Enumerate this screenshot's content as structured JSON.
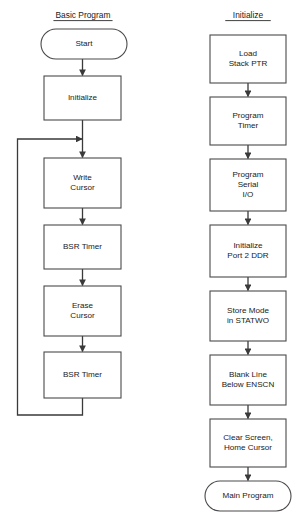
{
  "diagram": {
    "background_color": "#ffffff",
    "line_color": "#3a3a3a",
    "box_stroke_color": "#4a4a4a",
    "text_color": "#1a1a1a"
  },
  "columns": [
    {
      "id": "basic-program",
      "title": "Basic Program",
      "title_underlined": true,
      "title_x": 83,
      "title_y": 18,
      "nodes": [
        {
          "id": "start",
          "shape": "terminator",
          "lines": [
            "Start"
          ],
          "x": 41,
          "y": 29,
          "width": 86,
          "height": 30
        },
        {
          "id": "initialize",
          "shape": "process",
          "lines": [
            "Initialize"
          ],
          "x": 44,
          "y": 76,
          "width": 77,
          "height": 44
        },
        {
          "id": "write-cursor",
          "shape": "process",
          "lines": [
            "Write",
            "Cursor"
          ],
          "x": 44,
          "y": 158,
          "width": 77,
          "height": 50
        },
        {
          "id": "bsr-timer-1",
          "shape": "process",
          "lines": [
            "BSR Timer"
          ],
          "x": 44,
          "y": 225,
          "width": 77,
          "height": 44
        },
        {
          "id": "erase-cursor",
          "shape": "process",
          "lines": [
            "Erase",
            "Cursor"
          ],
          "x": 44,
          "y": 286,
          "width": 77,
          "height": 50
        },
        {
          "id": "bsr-timer-2",
          "shape": "process",
          "lines": [
            "BSR Timer"
          ],
          "x": 44,
          "y": 352,
          "width": 77,
          "height": 46
        }
      ],
      "connectors": [
        {
          "id": "c-start-init",
          "from": "start",
          "to": "initialize",
          "x": 82.5,
          "y1": 59,
          "y2": 76
        },
        {
          "id": "c-loopjoin-write",
          "from": "loop-join",
          "to": "write-cursor",
          "x": 82.5,
          "y1": 120,
          "y2": 158
        },
        {
          "id": "c-write-bsr1",
          "from": "write-cursor",
          "to": "bsr-timer-1",
          "x": 82.5,
          "y1": 208,
          "y2": 225
        },
        {
          "id": "c-bsr1-erase",
          "from": "bsr-timer-1",
          "to": "erase-cursor",
          "x": 82.5,
          "y1": 269,
          "y2": 286
        },
        {
          "id": "c-erase-bsr2",
          "from": "erase-cursor",
          "to": "bsr-timer-2",
          "x": 82.5,
          "y1": 336,
          "y2": 352
        }
      ],
      "loop": {
        "id": "feedback-loop",
        "description": "BSR Timer back to Write Cursor input",
        "from": "bsr-timer-2",
        "to": "write-cursor",
        "start_x": 82.5,
        "start_y": 398,
        "bottom_y": 415,
        "left_x": 17.5,
        "top_y": 139,
        "end_x": 82.5
      }
    },
    {
      "id": "initialize-routine",
      "title": "Initialize",
      "title_underlined": true,
      "title_x": 248,
      "title_y": 18,
      "nodes": [
        {
          "id": "load-stack-ptr",
          "shape": "process",
          "lines": [
            "Load",
            "Stack PTR"
          ],
          "x": 210,
          "y": 35,
          "width": 76,
          "height": 48
        },
        {
          "id": "program-timer",
          "shape": "process",
          "lines": [
            "Program",
            "Timer"
          ],
          "x": 210,
          "y": 97,
          "width": 76,
          "height": 48
        },
        {
          "id": "program-serial-io",
          "shape": "process",
          "lines": [
            "Program",
            "Serial",
            "I/O"
          ],
          "x": 210,
          "y": 159,
          "width": 76,
          "height": 52
        },
        {
          "id": "initialize-port2-ddr",
          "shape": "process",
          "lines": [
            "Initialize",
            "Port 2 DDR"
          ],
          "x": 210,
          "y": 225,
          "width": 76,
          "height": 52
        },
        {
          "id": "store-mode-statwo",
          "shape": "process",
          "lines": [
            "Store Mode",
            "in STATWO"
          ],
          "x": 210,
          "y": 291,
          "width": 76,
          "height": 50
        },
        {
          "id": "blank-line-enscn",
          "shape": "process",
          "lines": [
            "Blank Line",
            "Below ENSCN"
          ],
          "x": 210,
          "y": 355,
          "width": 76,
          "height": 50
        },
        {
          "id": "clear-screen-home-cursor",
          "shape": "process",
          "lines": [
            "Clear Screen,",
            "Home Cursor"
          ],
          "x": 210,
          "y": 419,
          "width": 76,
          "height": 48
        },
        {
          "id": "main-program",
          "shape": "terminator",
          "lines": [
            "Main Program"
          ],
          "x": 205,
          "y": 481,
          "width": 86,
          "height": 30
        }
      ],
      "connectors": [
        {
          "id": "c-load-timer",
          "from": "load-stack-ptr",
          "to": "program-timer",
          "x": 248,
          "y1": 83,
          "y2": 97
        },
        {
          "id": "c-timer-serial",
          "from": "program-timer",
          "to": "program-serial-io",
          "x": 248,
          "y1": 145,
          "y2": 159
        },
        {
          "id": "c-serial-port2",
          "from": "program-serial-io",
          "to": "initialize-port2-ddr",
          "x": 248,
          "y1": 211,
          "y2": 225
        },
        {
          "id": "c-port2-store",
          "from": "initialize-port2-ddr",
          "to": "store-mode-statwo",
          "x": 248,
          "y1": 277,
          "y2": 291
        },
        {
          "id": "c-store-blank",
          "from": "store-mode-statwo",
          "to": "blank-line-enscn",
          "x": 248,
          "y1": 341,
          "y2": 355
        },
        {
          "id": "c-blank-clear",
          "from": "blank-line-enscn",
          "to": "clear-screen-home-cursor",
          "x": 248,
          "y1": 405,
          "y2": 419
        },
        {
          "id": "c-clear-main",
          "from": "clear-screen-home-cursor",
          "to": "main-program",
          "x": 248,
          "y1": 467,
          "y2": 481
        }
      ],
      "loop": null
    }
  ]
}
